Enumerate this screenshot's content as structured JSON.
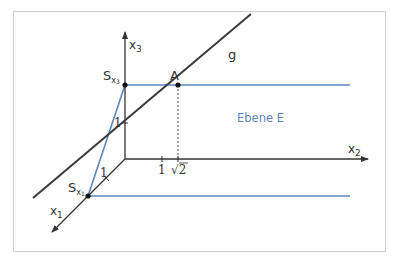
{
  "diagram": {
    "colors": {
      "axis": "#333333",
      "line_g": "#3a3a3a",
      "plane_edge": "#5b86c0",
      "frame": "#cfd3d6",
      "label": "#333333",
      "plane_label": "#5b86c0"
    },
    "axes": {
      "x1": {
        "label": "x",
        "sub": "1"
      },
      "x2": {
        "label": "x",
        "sub": "2"
      },
      "x3": {
        "label": "x",
        "sub": "3"
      }
    },
    "ticks": {
      "x1_one": "1",
      "x2_one": "1",
      "x2_sqrt2_radical": "√",
      "x2_sqrt2_value": "2",
      "x3_one": "1"
    },
    "points": {
      "A": {
        "label": "A"
      },
      "S_x3": {
        "label": "S",
        "sub": "x",
        "subsub": "3"
      },
      "S_x1": {
        "label": "S",
        "sub": "x",
        "subsub": "1"
      }
    },
    "line_label": "g",
    "plane_label": "Ebene E"
  }
}
